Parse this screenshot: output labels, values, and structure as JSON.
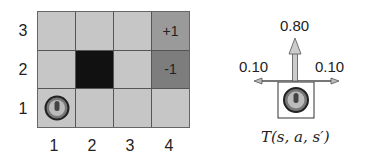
{
  "gridworld": {
    "rows": 3,
    "cols": 4,
    "row_labels": [
      "3",
      "2",
      "1"
    ],
    "col_labels": [
      "1",
      "2",
      "3",
      "4"
    ],
    "cells": [
      {
        "row": 3,
        "col": 1,
        "type": "empty",
        "text": ""
      },
      {
        "row": 3,
        "col": 2,
        "type": "empty",
        "text": ""
      },
      {
        "row": 3,
        "col": 3,
        "type": "empty",
        "text": ""
      },
      {
        "row": 3,
        "col": 4,
        "type": "terminal-positive",
        "text": "+1"
      },
      {
        "row": 2,
        "col": 1,
        "type": "empty",
        "text": ""
      },
      {
        "row": 2,
        "col": 2,
        "type": "wall",
        "text": ""
      },
      {
        "row": 2,
        "col": 3,
        "type": "empty",
        "text": ""
      },
      {
        "row": 2,
        "col": 4,
        "type": "terminal-negative",
        "text": "-1"
      },
      {
        "row": 1,
        "col": 1,
        "type": "agent",
        "text": ""
      },
      {
        "row": 1,
        "col": 2,
        "type": "empty",
        "text": ""
      },
      {
        "row": 1,
        "col": 3,
        "type": "empty",
        "text": ""
      },
      {
        "row": 1,
        "col": 4,
        "type": "empty",
        "text": ""
      }
    ],
    "colors": {
      "empty": "#c6c6c6",
      "wall": "#111111",
      "positive": "#9a9a9a",
      "negative": "#7d7d7d"
    }
  },
  "transition": {
    "intended_prob": "0.80",
    "left_prob": "0.10",
    "right_prob": "0.10",
    "caption": "T(s, a, s′)"
  }
}
